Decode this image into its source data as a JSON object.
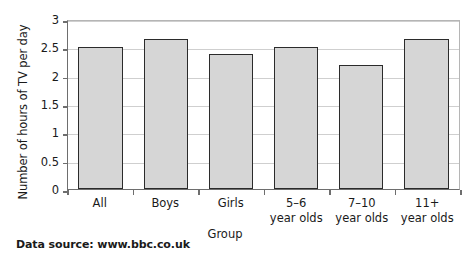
{
  "chart_data": {
    "type": "bar",
    "title": "",
    "categories": [
      "All",
      "Boys",
      "Girls",
      "5–6 year olds",
      "7–10 year olds",
      "11+ year olds"
    ],
    "category_lines": [
      [
        "All",
        ""
      ],
      [
        "Boys",
        ""
      ],
      [
        "Girls",
        ""
      ],
      [
        "5–6",
        "year olds"
      ],
      [
        "7–10",
        "year olds"
      ],
      [
        "11+",
        "year olds"
      ]
    ],
    "values": [
      2.5,
      2.65,
      2.38,
      2.5,
      2.18,
      2.65
    ],
    "xlabel": "Group",
    "ylabel": "Number of hours of TV per day",
    "ylim": [
      0,
      3
    ],
    "yticks": [
      0,
      0.5,
      1,
      1.5,
      2,
      2.5,
      3
    ],
    "ytick_labels": [
      "0",
      "0.5",
      "1",
      "1.5",
      "2",
      "2.5",
      "3"
    ],
    "grid": true,
    "legend": false,
    "bar_fill_color": "#d6d6d6",
    "bar_border_color": "#2b2b2b",
    "gridline_color": "#cfcfcf",
    "axis_color": "#6e6e6e"
  },
  "caption": {
    "source": "Data source: www.bbc.co.uk"
  }
}
